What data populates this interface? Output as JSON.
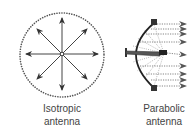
{
  "diagram": {
    "isotropic": {
      "label_line1": "Isotropic",
      "label_line2": "antenna",
      "center": [
        62,
        54
      ],
      "pattern_radius": 42,
      "arrow_count": 8,
      "arrow_length": 33
    },
    "parabolic": {
      "label_line1": "Parabolic",
      "label_line2": "antenna",
      "ray_count": 9
    },
    "colors": {
      "stroke": "#333333",
      "dots": "#555555",
      "text": "#444444"
    }
  }
}
